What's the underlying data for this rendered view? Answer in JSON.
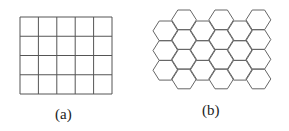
{
  "figure_a": {
    "label": "(a)",
    "type": "square-grid",
    "columns": 5,
    "rows": 4,
    "stroke": "#555555"
  },
  "figure_b": {
    "label": "(b)",
    "type": "hexagonal-grid",
    "columns": 6,
    "stroke": "#666666"
  }
}
